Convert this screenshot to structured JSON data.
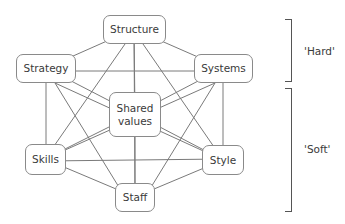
{
  "diagram": {
    "nodes": [
      {
        "id": "structure",
        "label": "Structure",
        "x": 103,
        "y": 15,
        "w": 63,
        "h": 29
      },
      {
        "id": "strategy",
        "label": "Strategy",
        "x": 16,
        "y": 54,
        "w": 60,
        "h": 29
      },
      {
        "id": "systems",
        "label": "Systems",
        "x": 194,
        "y": 54,
        "w": 59,
        "h": 29
      },
      {
        "id": "shared_values",
        "label": "Shared values",
        "x": 109,
        "y": 92,
        "w": 52,
        "h": 45
      },
      {
        "id": "skills",
        "label": "Skills",
        "x": 25,
        "y": 144,
        "w": 41,
        "h": 31
      },
      {
        "id": "style",
        "label": "Style",
        "x": 202,
        "y": 145,
        "w": 42,
        "h": 30
      },
      {
        "id": "staff",
        "label": "Staff",
        "x": 115,
        "y": 183,
        "w": 40,
        "h": 29
      }
    ],
    "edges": "all-pairs",
    "groups": [
      {
        "label": "'Hard'",
        "members": [
          "structure",
          "strategy",
          "systems"
        ]
      },
      {
        "label": "'Soft'",
        "members": [
          "shared_values",
          "skills",
          "style",
          "staff"
        ]
      }
    ]
  },
  "labels": {
    "structure": "Structure",
    "strategy": "Strategy",
    "systems": "Systems",
    "shared_line1": "Shared",
    "shared_line2": "values",
    "skills": "Skills",
    "style": "Style",
    "staff": "Staff",
    "hard": "'Hard'",
    "soft": "'Soft'"
  },
  "colors": {
    "line": "#7a7a7a",
    "border": "#8a8a8a",
    "text": "#3a3a3a"
  }
}
